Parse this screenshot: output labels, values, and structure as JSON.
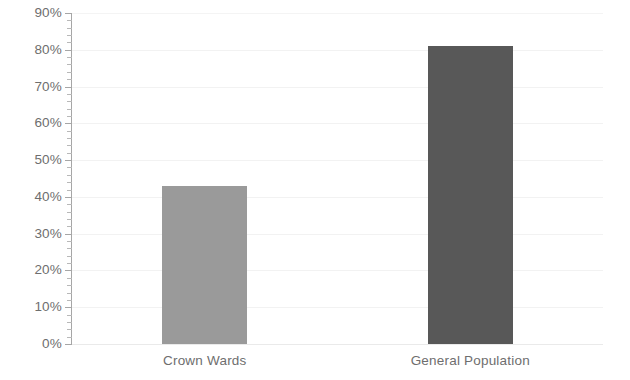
{
  "chart_data": {
    "type": "bar",
    "title": "",
    "subtitle": "",
    "xlabel": "",
    "ylabel": "",
    "categories": [
      "Crown Wards",
      "General Population"
    ],
    "values": [
      43,
      81
    ],
    "value_labels": [
      "43%",
      "81%"
    ],
    "series": [
      {
        "name": "",
        "values": [
          43,
          81
        ]
      }
    ],
    "ylim": [
      0,
      90
    ],
    "ytick_step": 10,
    "ytick_values": [
      0,
      10,
      20,
      30,
      40,
      50,
      60,
      70,
      80,
      90
    ],
    "ytick_labels": [
      "0%",
      "10%",
      "20%",
      "30%",
      "40%",
      "50%",
      "60%",
      "70%",
      "80%",
      "90%"
    ],
    "minor_ticks_between_majors": 4,
    "grid": true,
    "grid_axis": "y",
    "legend": false,
    "legend_position": "none",
    "annotations": [],
    "bar_colors": [
      "#9a9a9a",
      "#585858"
    ],
    "axis_color": "#a6a6a6",
    "gridline_color": "#f2f2f2",
    "tick_label_color": "#6e6e6e",
    "background_color": "#ffffff"
  }
}
